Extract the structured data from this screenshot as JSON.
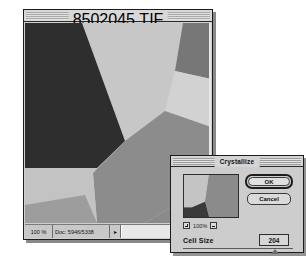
{
  "document_window": {
    "title": "8502045.TIF @ 100% (RGB)",
    "status_bar": {
      "zoom": "100 %",
      "doc_size": "Doc: 5946/5338",
      "scroll_arrow_glyph": "▸"
    },
    "image": {
      "description": "Crystallize-filtered photograph reduced to flat polygonal cells",
      "regions": [
        {
          "name": "dark-upper-left-polygon",
          "color": "#2f2f2f"
        },
        {
          "name": "light-center-polygon",
          "color": "#c8c8c8"
        },
        {
          "name": "mid-upper-right-polygon",
          "color": "#777777"
        },
        {
          "name": "light-right-polygon",
          "color": "#cfcfcf"
        },
        {
          "name": "mid-center-right-polygon",
          "color": "#8d8d8d"
        },
        {
          "name": "light-lower-left-polygon",
          "color": "#c3c3c3"
        },
        {
          "name": "mid-lower-left-polygon",
          "color": "#9a9a9a"
        },
        {
          "name": "mid-lower-right-polygon",
          "color": "#8a8a8a"
        }
      ]
    }
  },
  "dialog": {
    "title": "Crystallize",
    "ok_label": "OK",
    "cancel_label": "Cancel",
    "zoom_percent": "100%",
    "zoom_in_icon": "plus-icon",
    "zoom_out_icon": "minus-icon",
    "cell_size": {
      "label": "Cell Size",
      "value": "204"
    },
    "preview": {
      "description": "Thumbnail preview of crystallized image",
      "regions": [
        {
          "name": "preview-light-region",
          "color": "#c4c4c4"
        },
        {
          "name": "preview-dark-region",
          "color": "#3a3a3a"
        },
        {
          "name": "preview-mid-region",
          "color": "#8b8b8b"
        }
      ]
    }
  },
  "colors": {
    "window_chrome": "#cfcfcf",
    "dialog_face": "#cdcdcd",
    "outline": "#1c1c1c"
  }
}
